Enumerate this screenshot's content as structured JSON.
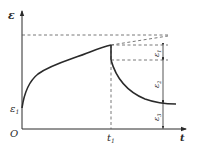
{
  "diagram": {
    "type": "creep-recovery strain-time curve",
    "axes": {
      "y_label": "ε",
      "x_label": "t",
      "origin_label": "O"
    },
    "markers": {
      "initial_strain_label": "ε",
      "initial_strain_sub": "1",
      "time_label": "t",
      "time_sub": "1"
    },
    "recovery_labels": [
      {
        "base": "ε",
        "sub": "1"
      },
      {
        "base": "ε",
        "sub": "2"
      },
      {
        "base": "ε",
        "sub": "3"
      }
    ],
    "colors": {
      "line": "#2a2a2a",
      "dashed": "#555555",
      "background": "#ffffff"
    }
  }
}
